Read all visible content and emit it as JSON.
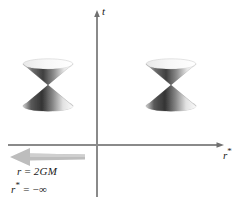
{
  "figure": {
    "background_color": "#ffffff",
    "width": 238,
    "height": 200
  },
  "axes": {
    "vertical": {
      "label": "t",
      "name": "time-axis",
      "color": "#8a8a8a",
      "x": 97,
      "y_top": 13,
      "y_bottom": 197,
      "arrow_at": "top"
    },
    "horizontal": {
      "label": "r*",
      "label_base": "r",
      "label_superscript": "*",
      "name": "tortoise-radial-axis",
      "color": "#8a8a8a",
      "y": 145,
      "x_left": 8,
      "x_right": 222,
      "arrow_at": "right"
    },
    "origin": {
      "x": 97,
      "y": 145
    }
  },
  "light_cones": [
    {
      "name": "left-light-cone",
      "vertex_x": 48,
      "vertex_y": 85,
      "top_y": 62,
      "bottom_y": 108,
      "half_width": 25,
      "ellipse_ry": 5,
      "dark_color": "#4d4d4d",
      "light_color": "#f2f2f2"
    },
    {
      "name": "right-light-cone",
      "vertex_x": 171,
      "vertex_y": 85,
      "top_y": 62,
      "bottom_y": 108,
      "half_width": 25,
      "ellipse_ry": 5,
      "dark_color": "#4d4d4d",
      "light_color": "#f2f2f2"
    }
  ],
  "arrow": {
    "name": "horizon-direction-arrow",
    "direction": "left",
    "color": "#b8b8b8",
    "tip_x": 10,
    "tail_x": 85,
    "center_y": 157,
    "head_half_height": 9,
    "shaft_half_height": 3.5
  },
  "annotations": {
    "line1": {
      "text": "r = 2GM",
      "variable": "r",
      "relation": "=",
      "value": "2GM"
    },
    "line2": {
      "text": "r* = −∞",
      "variable_base": "r",
      "variable_superscript": "*",
      "relation": "=",
      "value": "−∞"
    }
  },
  "colors": {
    "axis": "#8a8a8a",
    "text": "#1a1a1a",
    "arrow": "#b8b8b8",
    "cone_dark": "#4d4d4d",
    "cone_light": "#f2f2f2"
  }
}
